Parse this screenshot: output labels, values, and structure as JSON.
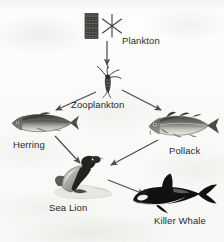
{
  "diagram": {
    "background_color": "#fbfbfa",
    "text_color": "#2a2a2a",
    "arrow_color": "#4a4a4a",
    "nodes": [
      {
        "id": "plankton",
        "label": "Plankton",
        "icon": "plankton-icon",
        "trophic_level": 1,
        "label_x": 122,
        "label_y": 36
      },
      {
        "id": "zooplankton",
        "label": "Zooplankton",
        "icon": "zooplankton-icon",
        "trophic_level": 2,
        "label_x": 71,
        "label_y": 100
      },
      {
        "id": "herring",
        "label": "Herring",
        "icon": "herring-icon",
        "trophic_level": 3,
        "label_x": 13,
        "label_y": 140
      },
      {
        "id": "pollack",
        "label": "Pollack",
        "icon": "pollack-icon",
        "trophic_level": 3,
        "label_x": 169,
        "label_y": 146
      },
      {
        "id": "sea-lion",
        "label": "Sea Lion",
        "icon": "sea-lion-icon",
        "trophic_level": 4,
        "label_x": 49,
        "label_y": 203
      },
      {
        "id": "killer-whale",
        "label": "Killer Whale",
        "icon": "killer-whale-icon",
        "trophic_level": 5,
        "label_x": 154,
        "label_y": 216
      }
    ],
    "arrows": [
      {
        "id": "plankton-to-zooplankton",
        "from": "plankton",
        "to": "zooplankton"
      },
      {
        "id": "zooplankton-to-herring",
        "from": "zooplankton",
        "to": "herring"
      },
      {
        "id": "zooplankton-to-pollack",
        "from": "zooplankton",
        "to": "pollack"
      },
      {
        "id": "herring-to-sea-lion",
        "from": "herring",
        "to": "sea-lion"
      },
      {
        "id": "pollack-to-sea-lion",
        "from": "pollack",
        "to": "sea-lion"
      },
      {
        "id": "sea-lion-to-killer-whale",
        "from": "sea-lion",
        "to": "killer-whale"
      }
    ]
  }
}
